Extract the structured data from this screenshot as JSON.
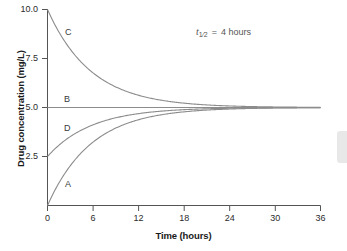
{
  "chart_data": {
    "type": "line",
    "title": "",
    "xlabel": "Time (hours)",
    "ylabel": "Drug concentration (mg/L)",
    "xlim": [
      0,
      36
    ],
    "ylim": [
      0,
      10
    ],
    "xticks": [
      "0",
      "6",
      "12",
      "18",
      "24",
      "30",
      "36"
    ],
    "yticks": [
      "2.5",
      "5.0",
      "7.5",
      "10.0"
    ],
    "grid": false,
    "legend_position": "inline-curve-labels",
    "annotation": {
      "symbol": "t",
      "subscript": "1/2",
      "equals": "=",
      "value": "4 hours",
      "full_text": "t1/2 = 4 hours"
    },
    "steady_state": 5.0,
    "half_life_hours": 4,
    "series": [
      {
        "name": "A",
        "label": "A",
        "start": 0.0,
        "end": 5.0,
        "shape": "rising-exponential",
        "color": "#8c8c8c",
        "x": [
          0,
          2,
          4,
          6,
          8,
          10,
          12,
          14,
          16,
          18,
          20,
          22,
          24,
          26,
          28,
          30,
          32,
          34,
          36
        ],
        "y": [
          0.0,
          1.46,
          2.5,
          3.23,
          3.75,
          4.12,
          4.38,
          4.56,
          4.69,
          4.78,
          4.84,
          4.89,
          4.92,
          4.95,
          4.96,
          4.97,
          4.98,
          4.99,
          4.99
        ]
      },
      {
        "name": "B",
        "label": "B",
        "start": 5.0,
        "end": 5.0,
        "shape": "flat",
        "color": "#8c8c8c",
        "x": [
          0,
          6,
          12,
          18,
          24,
          30,
          36
        ],
        "y": [
          5.0,
          5.0,
          5.0,
          5.0,
          5.0,
          5.0,
          5.0
        ]
      },
      {
        "name": "C",
        "label": "C",
        "start": 10.0,
        "end": 5.0,
        "shape": "decaying-exponential",
        "color": "#8c8c8c",
        "x": [
          0,
          2,
          4,
          6,
          8,
          10,
          12,
          14,
          16,
          18,
          20,
          22,
          24,
          26,
          28,
          30,
          32,
          34,
          36
        ],
        "y": [
          10.0,
          8.54,
          7.5,
          6.77,
          6.25,
          5.88,
          5.63,
          5.44,
          5.31,
          5.22,
          5.16,
          5.11,
          5.08,
          5.05,
          5.04,
          5.03,
          5.02,
          5.01,
          5.01
        ]
      },
      {
        "name": "D",
        "label": "D",
        "start": 2.5,
        "end": 5.0,
        "shape": "rising-exponential",
        "color": "#8c8c8c",
        "x": [
          0,
          2,
          4,
          6,
          8,
          10,
          12,
          14,
          16,
          18,
          20,
          22,
          24,
          26,
          28,
          30,
          32,
          34,
          36
        ],
        "y": [
          2.5,
          3.23,
          3.75,
          4.12,
          4.38,
          4.56,
          4.69,
          4.78,
          4.84,
          4.89,
          4.92,
          4.95,
          4.96,
          4.97,
          4.98,
          4.99,
          4.99,
          4.99,
          5.0
        ]
      }
    ]
  },
  "axes": {
    "y_title": "Drug concentration (mg/L)",
    "x_title": "Time (hours)",
    "y_ticks": [
      {
        "label": "10.0",
        "value": 10.0
      },
      {
        "label": "7.5",
        "value": 7.5
      },
      {
        "label": "5.0",
        "value": 5.0
      },
      {
        "label": "2.5",
        "value": 2.5
      }
    ],
    "x_ticks": [
      {
        "label": "0",
        "value": 0
      },
      {
        "label": "6",
        "value": 6
      },
      {
        "label": "12",
        "value": 12
      },
      {
        "label": "18",
        "value": 18
      },
      {
        "label": "24",
        "value": 24
      },
      {
        "label": "30",
        "value": 30
      },
      {
        "label": "36",
        "value": 36
      }
    ]
  },
  "curve_labels": {
    "a": "A",
    "b": "B",
    "c": "C",
    "d": "D"
  },
  "annotation": {
    "symbol": "t",
    "subscript": "1⁄2",
    "equals": "=",
    "value": "4 hours"
  },
  "colors": {
    "curve": "#8c8c8c",
    "axis": "#555555",
    "text": "#1a1a1a",
    "annotation_text": "#555555",
    "background": "#ffffff"
  }
}
